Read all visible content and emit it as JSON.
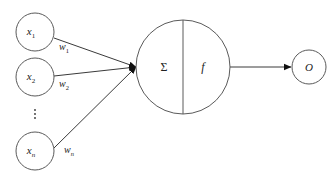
{
  "diagram": {
    "type": "perceptron",
    "inputs": [
      {
        "label": "x",
        "subscript": "1",
        "weight_label": "w",
        "weight_subscript": "1"
      },
      {
        "label": "x",
        "subscript": "2",
        "weight_label": "w",
        "weight_subscript": "2"
      },
      {
        "label": "x",
        "subscript": "n",
        "weight_label": "w",
        "weight_subscript": "n"
      }
    ],
    "ellipsis": "⋮",
    "neuron": {
      "sum_symbol": "Σ",
      "activation_symbol": "f"
    },
    "output": {
      "label": "O"
    }
  }
}
